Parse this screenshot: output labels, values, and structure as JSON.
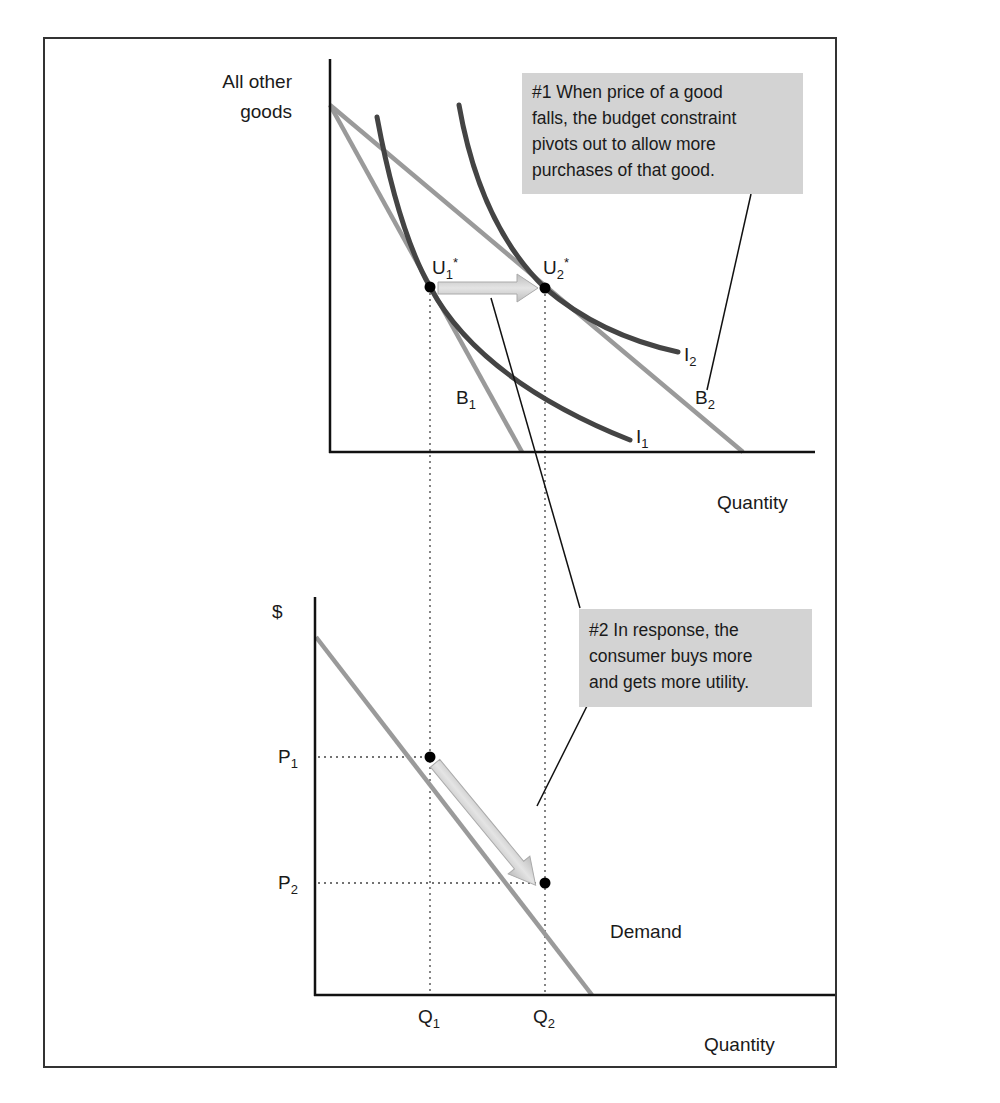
{
  "top_chart": {
    "y_axis_label_line1": "All other",
    "y_axis_label_line2": "goods",
    "x_axis_label": "Quantity",
    "points": {
      "u1": {
        "base": "U",
        "sub": "1",
        "sup": "*"
      },
      "u2": {
        "base": "U",
        "sub": "2",
        "sup": "*"
      }
    },
    "budget_lines": {
      "b1": {
        "base": "B",
        "sub": "1"
      },
      "b2": {
        "base": "B",
        "sub": "2"
      }
    },
    "indifference_curves": {
      "i1": {
        "base": "I",
        "sub": "1"
      },
      "i2": {
        "base": "I",
        "sub": "2"
      }
    },
    "callout": {
      "lines": [
        "#1 When price of a good",
        "falls, the budget constraint",
        "pivots out to allow more",
        "purchases of that good."
      ]
    }
  },
  "bottom_chart": {
    "y_axis_label": "$",
    "x_axis_label": "Quantity",
    "curve_label": "Demand",
    "prices": {
      "p1": {
        "base": "P",
        "sub": "1"
      },
      "p2": {
        "base": "P",
        "sub": "2"
      }
    },
    "quantities": {
      "q1": {
        "base": "Q",
        "sub": "1"
      },
      "q2": {
        "base": "Q",
        "sub": "2"
      }
    },
    "callout": {
      "lines": [
        "#2 In response, the",
        "consumer buys more",
        "and gets more utility."
      ]
    }
  },
  "colors": {
    "axis": "#111111",
    "budget_line": "#9a9a9a",
    "indifference_curve": "#444444",
    "demand_line": "#9a9a9a",
    "arrow_fill": "#c8c8c8",
    "callout_bg": "#d3d3d3",
    "frame": "#333333"
  }
}
